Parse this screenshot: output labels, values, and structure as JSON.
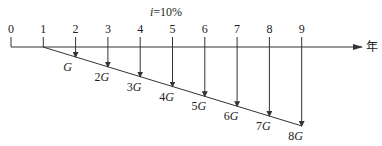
{
  "diagram": {
    "type": "cash-flow-diagram",
    "rate_label_prefix": "i",
    "rate_label_rest": "=10%",
    "axis_unit": "年",
    "periods": [
      "0",
      "1",
      "2",
      "3",
      "4",
      "5",
      "6",
      "7",
      "8",
      "9"
    ],
    "gradient_labels": [
      "G",
      "2G",
      "3G",
      "4G",
      "5G",
      "6G",
      "7G",
      "8G"
    ],
    "line_color": "#333333"
  }
}
